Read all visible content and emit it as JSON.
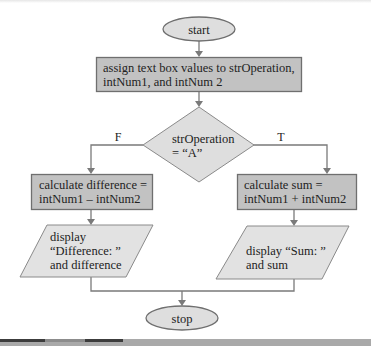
{
  "diagram": {
    "type": "flowchart",
    "colors": {
      "terminal_fill": "#dedede",
      "process_fill": "#c2c2c2",
      "decision_fill": "#dedede",
      "io_fill": "#e2e2e2",
      "stroke": "#6f6f6f",
      "connector": "#7a7a7a"
    },
    "nodes": {
      "start": {
        "shape": "terminal",
        "label": "start"
      },
      "assign": {
        "shape": "process",
        "lines": [
          "assign text box values to strOperation,",
          "intNum1, and intNum 2"
        ]
      },
      "decision": {
        "shape": "decision",
        "lines": [
          "strOperation",
          "= “A”"
        ]
      },
      "calc_diff": {
        "shape": "process",
        "lines": [
          "calculate difference =",
          "intNum1 – intNum2"
        ]
      },
      "calc_sum": {
        "shape": "process",
        "lines": [
          "calculate sum =",
          "intNum1 + intNum2"
        ]
      },
      "display_diff": {
        "shape": "io",
        "lines": [
          "display",
          "“Difference: ”",
          "and difference"
        ]
      },
      "display_sum": {
        "shape": "io",
        "lines": [
          "display “Sum: ”",
          "and sum"
        ]
      },
      "stop": {
        "shape": "terminal",
        "label": "stop"
      }
    },
    "branches": {
      "false_label": "F",
      "true_label": "T"
    },
    "edges": [
      {
        "from": "start",
        "to": "assign"
      },
      {
        "from": "assign",
        "to": "decision"
      },
      {
        "from": "decision",
        "to": "calc_diff",
        "label": "F"
      },
      {
        "from": "decision",
        "to": "calc_sum",
        "label": "T"
      },
      {
        "from": "calc_diff",
        "to": "display_diff"
      },
      {
        "from": "calc_sum",
        "to": "display_sum"
      },
      {
        "from": "display_diff",
        "to": "stop"
      },
      {
        "from": "display_sum",
        "to": "stop"
      }
    ]
  }
}
